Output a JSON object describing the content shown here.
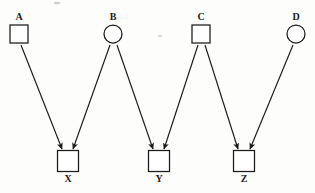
{
  "figure": {
    "kind": "bipartite-arrow-diagram",
    "background_color": "#fdfdfc",
    "stroke_color": "#1a1a1a",
    "width": 315,
    "height": 193
  },
  "nodes": {
    "top": [
      {
        "id": "A",
        "label": "A",
        "shape": "square",
        "cx": 19,
        "cy": 34,
        "size": 18,
        "label_x": 19,
        "label_y": 20
      },
      {
        "id": "B",
        "label": "B",
        "shape": "circle",
        "cx": 113,
        "cy": 34,
        "size": 18,
        "label_x": 113,
        "label_y": 20
      },
      {
        "id": "C",
        "label": "C",
        "shape": "square",
        "cx": 201,
        "cy": 34,
        "size": 18,
        "label_x": 201,
        "label_y": 20
      },
      {
        "id": "D",
        "label": "D",
        "shape": "circle",
        "cx": 296,
        "cy": 34,
        "size": 18,
        "label_x": 296,
        "label_y": 20
      }
    ],
    "bottom": [
      {
        "id": "X",
        "label": "X",
        "shape": "square",
        "cx": 68,
        "cy": 161,
        "size": 21,
        "label_x": 68,
        "label_y": 182
      },
      {
        "id": "Y",
        "label": "Y",
        "shape": "square",
        "cx": 159,
        "cy": 161,
        "size": 21,
        "label_x": 159,
        "label_y": 182
      },
      {
        "id": "Z",
        "label": "Z",
        "shape": "square",
        "cx": 244,
        "cy": 161,
        "size": 21,
        "label_x": 244,
        "label_y": 182
      }
    ]
  },
  "edges": [
    {
      "id": "A-X",
      "from": "A",
      "to": "X",
      "x1": 21,
      "y1": 45,
      "x2": 62,
      "y2": 149
    },
    {
      "id": "B-X",
      "from": "B",
      "to": "X",
      "x1": 110,
      "y1": 45,
      "x2": 73,
      "y2": 149
    },
    {
      "id": "B-Y",
      "from": "B",
      "to": "Y",
      "x1": 117,
      "y1": 45,
      "x2": 153,
      "y2": 149
    },
    {
      "id": "C-Y",
      "from": "C",
      "to": "Y",
      "x1": 198,
      "y1": 45,
      "x2": 164,
      "y2": 149
    },
    {
      "id": "C-Z",
      "from": "C",
      "to": "Z",
      "x1": 205,
      "y1": 45,
      "x2": 238,
      "y2": 149
    },
    {
      "id": "D-Z",
      "from": "D",
      "to": "Z",
      "x1": 293,
      "y1": 45,
      "x2": 250,
      "y2": 149
    }
  ],
  "artifacts": [
    {
      "id": "speck-top",
      "cx": 57,
      "cy": 3,
      "rx": 3.2,
      "ry": 1.3
    },
    {
      "id": "speck-mid",
      "cx": 160,
      "cy": 36,
      "rx": 2.2,
      "ry": 1.0
    }
  ]
}
